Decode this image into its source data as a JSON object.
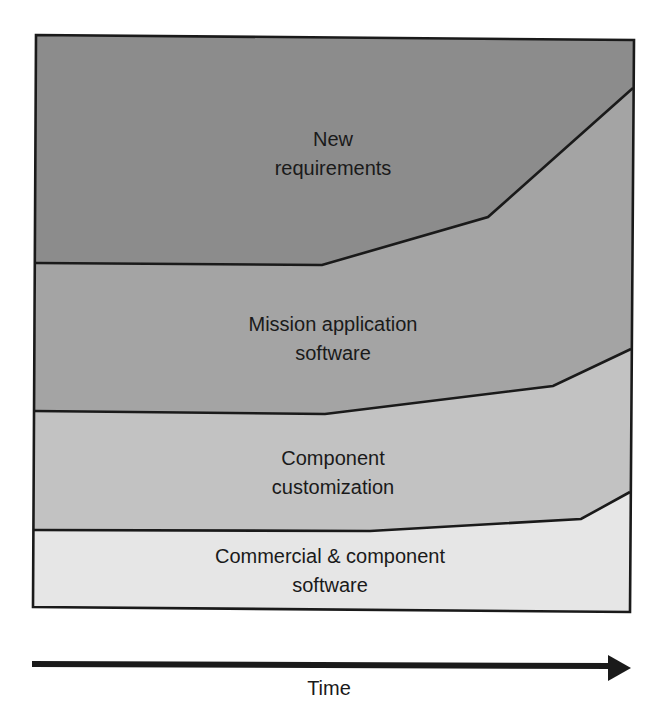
{
  "diagram": {
    "type": "stacked-area-schematic",
    "frame": {
      "top_left": [
        36,
        35
      ],
      "top_right": [
        634,
        40
      ],
      "bottom_right": [
        630,
        612
      ],
      "bottom_left": [
        33,
        607
      ],
      "stroke": "#1a1a1a"
    },
    "boundaries": [
      {
        "name": "new-req-vs-mission",
        "points": [
          [
            36,
            263
          ],
          [
            322,
            265
          ],
          [
            488,
            217
          ],
          [
            633,
            88
          ]
        ]
      },
      {
        "name": "mission-vs-customization",
        "points": [
          [
            34,
            411
          ],
          [
            325,
            414
          ],
          [
            553,
            386
          ],
          [
            631,
            349
          ]
        ]
      },
      {
        "name": "customization-vs-commercial",
        "points": [
          [
            34,
            530
          ],
          [
            370,
            531
          ],
          [
            581,
            519
          ],
          [
            630,
            492
          ]
        ]
      }
    ],
    "bands": [
      {
        "id": "new-requirements",
        "lines": [
          "New",
          "requirements"
        ],
        "color": "#8c8c8c",
        "label_x": 333,
        "label_y": [
          146,
          175
        ]
      },
      {
        "id": "mission-application-software",
        "lines": [
          "Mission application",
          "software"
        ],
        "color": "#a4a4a4",
        "label_x": 333,
        "label_y": [
          331,
          360
        ]
      },
      {
        "id": "component-customization",
        "lines": [
          "Component",
          "customization"
        ],
        "color": "#c2c2c2",
        "label_x": 333,
        "label_y": [
          465,
          494
        ]
      },
      {
        "id": "commercial-component-software",
        "lines": [
          "Commercial & component",
          "software"
        ],
        "color": "#e6e6e6",
        "label_x": 330,
        "label_y": [
          563,
          592
        ]
      }
    ],
    "axis": {
      "label": "Time",
      "shaft": {
        "x1": 32,
        "y1": 664,
        "x2": 612,
        "y2": 666
      },
      "head": [
        [
          608,
          655
        ],
        [
          631,
          668
        ],
        [
          608,
          681
        ]
      ],
      "label_x": 329,
      "label_y": 695,
      "color": "#1a1a1a"
    }
  }
}
